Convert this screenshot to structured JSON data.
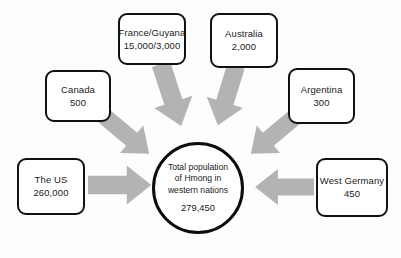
{
  "diagram": {
    "title": "Total population of Hmong in western nations",
    "arrow_color": "#b3b3b3",
    "node_border_color": "#111111",
    "background_color": "#fdfdfd",
    "hub": {
      "line1": "Total population",
      "line2": "of Hmong in",
      "line3": "western nations",
      "total": "279,450"
    },
    "nodes": [
      {
        "id": "canada",
        "name": "Canada",
        "value": "500"
      },
      {
        "id": "france-guyana",
        "name": "France/Guyana",
        "value": "15,000/3,000"
      },
      {
        "id": "australia",
        "name": "Australia",
        "value": "2,000"
      },
      {
        "id": "argentina",
        "name": "Argentina",
        "value": "300"
      },
      {
        "id": "the-us",
        "name": "The US",
        "value": "260,000"
      },
      {
        "id": "west-germany",
        "name": "West Germany",
        "value": "450"
      }
    ]
  }
}
